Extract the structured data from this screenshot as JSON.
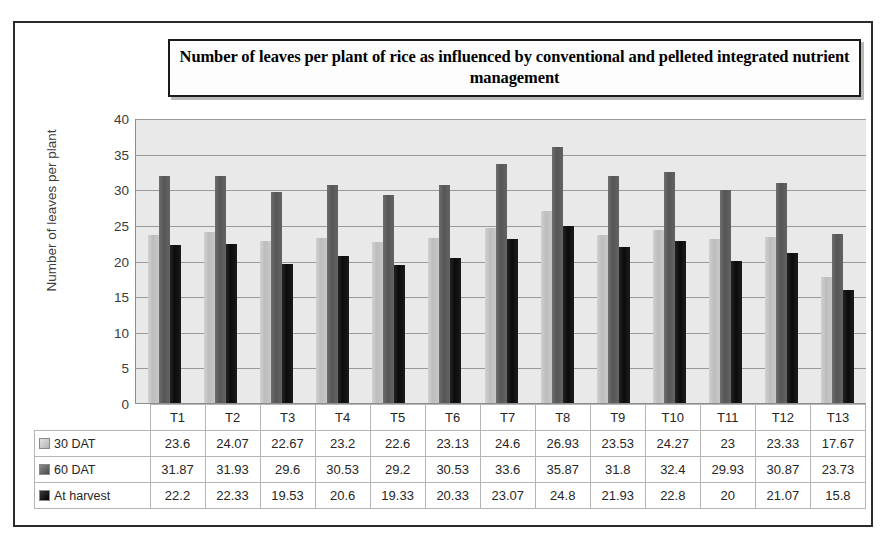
{
  "chart_data": {
    "type": "bar",
    "title": "Number of leaves per plant of rice as influenced by conventional and pelleted integrated nutrient management",
    "xlabel": "",
    "ylabel": "Number of leaves per plant",
    "ylim": [
      0,
      40
    ],
    "ytick_step": 5,
    "yticks": [
      "40",
      "35",
      "30",
      "25",
      "20",
      "15",
      "10",
      "5",
      "0"
    ],
    "grid": true,
    "legend_position": "table-below",
    "categories": [
      "T1",
      "T2",
      "T3",
      "T4",
      "T5",
      "T6",
      "T7",
      "T8",
      "T9",
      "T10",
      "T11",
      "T12",
      "T13"
    ],
    "series": [
      {
        "name": "30 DAT",
        "color": "#c4c4c4",
        "values": [
          23.6,
          24.07,
          22.67,
          23.2,
          22.6,
          23.13,
          24.6,
          26.93,
          23.53,
          24.27,
          23,
          23.33,
          17.67
        ],
        "labels": [
          "23.6",
          "24.07",
          "22.67",
          "23.2",
          "22.6",
          "23.13",
          "24.6",
          "26.93",
          "23.53",
          "24.27",
          "23",
          "23.33",
          "17.67"
        ]
      },
      {
        "name": "60 DAT",
        "color": "#5d5d5d",
        "values": [
          31.87,
          31.93,
          29.6,
          30.53,
          29.2,
          30.53,
          33.6,
          35.87,
          31.8,
          32.4,
          29.93,
          30.87,
          23.73
        ],
        "labels": [
          "31.87",
          "31.93",
          "29.6",
          "30.53",
          "29.2",
          "30.53",
          "33.6",
          "35.87",
          "31.8",
          "32.4",
          "29.93",
          "30.87",
          "23.73"
        ]
      },
      {
        "name": "At harvest",
        "color": "#121212",
        "values": [
          22.2,
          22.33,
          19.53,
          20.6,
          19.33,
          20.33,
          23.07,
          24.8,
          21.93,
          22.8,
          20,
          21.07,
          15.8
        ],
        "labels": [
          "22.2",
          "22.33",
          "19.53",
          "20.6",
          "19.33",
          "20.33",
          "23.07",
          "24.8",
          "21.93",
          "22.8",
          "20",
          "21.07",
          "15.8"
        ]
      }
    ]
  },
  "plot_area": {
    "background_color": "#e9e9e9",
    "gridline_color": "#9a9a9a"
  },
  "figure": {
    "border_color": "#2b2b2b",
    "background_color": "#ffffff"
  }
}
